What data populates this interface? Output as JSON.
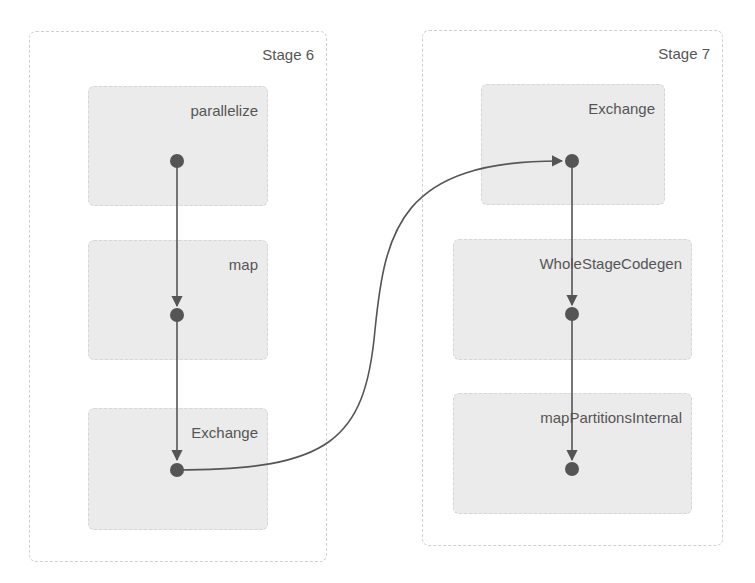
{
  "diagram": {
    "colors": {
      "edge": "#555555",
      "dot": "#555555",
      "node_fill": "#ebebeb",
      "stage_border": "#cfcfcf",
      "text": "#555555"
    },
    "stages": [
      {
        "label": "Stage 6",
        "nodes": [
          {
            "label": "parallelize"
          },
          {
            "label": "map"
          },
          {
            "label": "Exchange"
          }
        ]
      },
      {
        "label": "Stage 7",
        "nodes": [
          {
            "label": "Exchange"
          },
          {
            "label": "WholeStageCodegen"
          },
          {
            "label": "mapPartitionsInternal"
          }
        ]
      }
    ],
    "edges": [
      {
        "from": "Stage 6 / parallelize",
        "to": "Stage 6 / map"
      },
      {
        "from": "Stage 6 / map",
        "to": "Stage 6 / Exchange"
      },
      {
        "from": "Stage 6 / Exchange",
        "to": "Stage 7 / Exchange"
      },
      {
        "from": "Stage 7 / Exchange",
        "to": "Stage 7 / WholeStageCodegen"
      },
      {
        "from": "Stage 7 / WholeStageCodegen",
        "to": "Stage 7 / mapPartitionsInternal"
      }
    ]
  }
}
